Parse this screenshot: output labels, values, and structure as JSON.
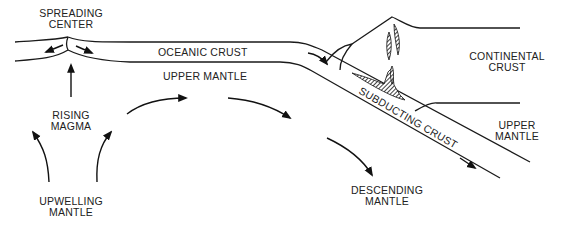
{
  "diagram": {
    "labels": {
      "spreading_center": [
        "SPREADING",
        "CENTER"
      ],
      "oceanic_crust": "OCEANIC CRUST",
      "upper_mantle_left": "UPPER MANTLE",
      "rising_magma": [
        "RISING",
        "MAGMA"
      ],
      "upwelling_mantle": [
        "UPWELLING",
        "MANTLE"
      ],
      "continental_crust": [
        "CONTINENTAL",
        "CRUST"
      ],
      "subducting_crust": "SUBDUCTING CRUST",
      "upper_mantle_right": [
        "UPPER",
        "MANTLE"
      ],
      "descending_mantle": [
        "DESCENDING",
        "MANTLE"
      ]
    },
    "colors": {
      "ink": "#1a1a1a",
      "background": "#ffffff"
    }
  }
}
